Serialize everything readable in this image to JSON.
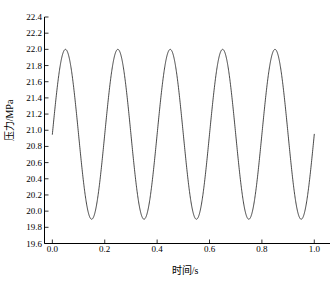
{
  "chart_data": {
    "type": "line",
    "title": "",
    "xlabel": "时间/s",
    "ylabel": "压力/MPa",
    "xlim": [
      -0.03,
      1.06
    ],
    "ylim": [
      19.6,
      22.4
    ],
    "grid": false,
    "legend": null,
    "xticks": [
      0.0,
      0.2,
      0.4,
      0.6,
      0.8,
      1.0
    ],
    "xtick_labels": [
      "0.0",
      "0.2",
      "0.4",
      "0.6",
      "0.8",
      "1.0"
    ],
    "yticks": [
      19.6,
      19.8,
      20.0,
      20.2,
      20.4,
      20.6,
      20.8,
      21.0,
      21.2,
      21.4,
      21.6,
      21.8,
      22.0,
      22.2,
      22.4
    ],
    "ytick_labels": [
      "19.6",
      "19.8",
      "20.0",
      "20.2",
      "20.4",
      "20.6",
      "20.8",
      "21.0",
      "21.2",
      "21.4",
      "21.6",
      "21.8",
      "22.0",
      "22.2",
      "22.4"
    ],
    "series": [
      {
        "name": "pressure",
        "color": "#1a1a1a",
        "line_width": 0.8,
        "waveform": "sine",
        "mean": 20.95,
        "amplitude": 1.05,
        "frequency_hz": 5,
        "period_s": 0.2,
        "phase_deg": 0,
        "t_start": 0.0,
        "t_end": 1.0,
        "peak_value": 22.0,
        "trough_value": 19.9,
        "peak_times": [
          0.05,
          0.25,
          0.45,
          0.65,
          0.85
        ],
        "trough_times": [
          0.15,
          0.35,
          0.55,
          0.75,
          0.95
        ],
        "start_value": 20.95,
        "end_value": 20.95,
        "cycles": 5
      }
    ],
    "axes": {
      "spines": [
        "left",
        "bottom"
      ],
      "tick_direction": "in",
      "axis_color": "#000000"
    }
  }
}
